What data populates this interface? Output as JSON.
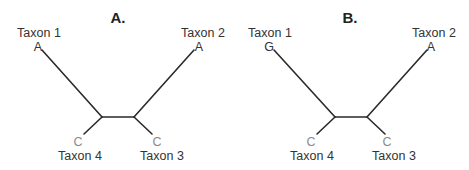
{
  "panels": [
    {
      "title": "A.",
      "taxa": {
        "taxon1": {
          "label": "Taxon 1",
          "state": "A"
        },
        "taxon2": {
          "label": "Taxon 2",
          "state": "A"
        },
        "taxon3": {
          "label": "Taxon 3",
          "state": "C"
        },
        "taxon4": {
          "label": "Taxon 4",
          "state": "C"
        }
      }
    },
    {
      "title": "B.",
      "taxa": {
        "taxon1": {
          "label": "Taxon 1",
          "state": "G"
        },
        "taxon2": {
          "label": "Taxon 2",
          "state": "A"
        },
        "taxon3": {
          "label": "Taxon 3",
          "state": "C"
        },
        "taxon4": {
          "label": "Taxon 4",
          "state": "C"
        }
      }
    }
  ],
  "colors": {
    "branch": "#2a2a2a",
    "text": "#333333",
    "state_light": "#8a8a8a"
  }
}
